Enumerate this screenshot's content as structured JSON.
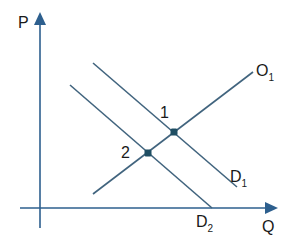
{
  "diagram": {
    "type": "supply-demand",
    "colors": {
      "axis": "#2d5f8e",
      "line": "#41647e",
      "point": "#1f4e63",
      "text": "#1a1a1a"
    },
    "axes": {
      "y_label": "P",
      "x_label": "Q"
    },
    "curves": [
      {
        "id": "O1",
        "label": "O",
        "subscript": "1",
        "x1": 93,
        "y1": 194,
        "x2": 253,
        "y2": 72
      },
      {
        "id": "D1",
        "label": "D",
        "subscript": "1",
        "x1": 93,
        "y1": 63,
        "x2": 237,
        "y2": 187
      },
      {
        "id": "D2",
        "label": "D",
        "subscript": "2",
        "x1": 70,
        "y1": 85,
        "x2": 212,
        "y2": 208
      }
    ],
    "points": [
      {
        "id": "1",
        "label": "1",
        "x": 174,
        "y": 132
      },
      {
        "id": "2",
        "label": "2",
        "x": 148,
        "y": 153
      }
    ]
  }
}
